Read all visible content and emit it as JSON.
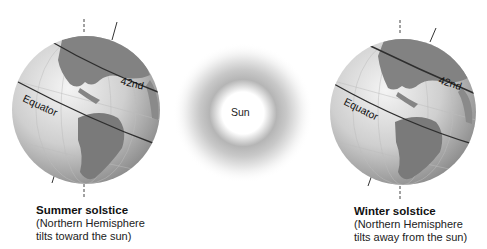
{
  "diagram": {
    "type": "solstice-earth-tilt",
    "sun": {
      "label": "Sun"
    },
    "left_globe": {
      "latitude_label": "42nd",
      "equator_label": "Equator",
      "caption_title": "Summer solstice",
      "caption_line1": "(Northern Hemisphere",
      "caption_line2": "tilts toward the sun)"
    },
    "right_globe": {
      "latitude_label": "42nd",
      "equator_label": "Equator",
      "caption_title": "Winter solstice",
      "caption_line1": "(Northern Hemisphere",
      "caption_line2": "tilts away from the sun)"
    },
    "colors": {
      "globe_light": "#eeeeee",
      "globe_dark": "#8a8a8a",
      "land": "#7d7d7d",
      "line": "#333333",
      "sun_glow": "#9a9a9a"
    }
  }
}
